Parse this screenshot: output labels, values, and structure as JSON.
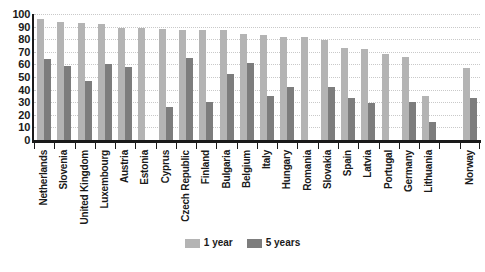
{
  "chart_data": {
    "type": "bar",
    "title": "",
    "subtitle": "",
    "xlabel": "",
    "ylabel": "",
    "ylim": [
      0,
      100
    ],
    "ytick_step": 10,
    "yticks": [
      "100",
      "90",
      "80",
      "70",
      "60",
      "50",
      "40",
      "30",
      "20",
      "10",
      "0"
    ],
    "grid": true,
    "legend_position": "bottom-center",
    "categories": [
      "Netherlands",
      "Slovenia",
      "United Kingdom",
      "Luxembourg",
      "Austria",
      "Estonia",
      "Cyprus",
      "Czech Republic",
      "Finland",
      "Bulgaria",
      "Belgium",
      "Italy",
      "Hungary",
      "Romania",
      "Slovakia",
      "Spain",
      "Latvia",
      "Portugal",
      "Germany",
      "Lithuania",
      "",
      "Norway"
    ],
    "series": [
      {
        "name": "1 year",
        "color": "#b4b4b4",
        "values": [
          96,
          94,
          93,
          92,
          89,
          89,
          88,
          87,
          87,
          87,
          84,
          83,
          82,
          82,
          79,
          73,
          72,
          68,
          66,
          35,
          null,
          57
        ]
      },
      {
        "name": "5 years",
        "color": "#7d7d7d",
        "values": [
          64,
          59,
          47,
          60,
          58,
          0,
          26,
          65,
          30,
          52,
          61,
          35,
          42,
          0,
          42,
          33,
          29,
          0,
          30,
          14,
          null,
          33
        ]
      }
    ]
  },
  "legend": {
    "items": [
      {
        "label": "1 year",
        "color": "#b4b4b4"
      },
      {
        "label": "5 years",
        "color": "#7d7d7d"
      }
    ]
  },
  "colors": {
    "one_year": "#b4b4b4",
    "five_year": "#7d7d7d",
    "axis": "#1a1a1a",
    "grid": "#c9c9c9",
    "background": "#ffffff"
  }
}
